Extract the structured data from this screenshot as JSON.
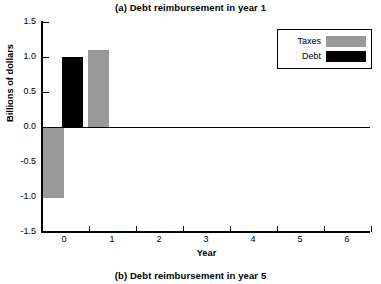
{
  "titles": {
    "top": "(a) Debt reimbursement in year 1",
    "bottom": "(b) Debt reimbursement in year 5"
  },
  "legend": {
    "items": [
      {
        "label": "Taxes",
        "color": "#999999"
      },
      {
        "label": "Debt",
        "color": "#000000"
      }
    ]
  },
  "colors": {
    "taxes": "#999999",
    "debt": "#000000",
    "axis": "#000000",
    "background": "#ffffff"
  },
  "chart_data": {
    "type": "bar",
    "title": "(a) Debt reimbursement in year 1",
    "subtitle": "(b) Debt reimbursement in year 5",
    "xlabel": "Year",
    "ylabel": "Billions of dollars",
    "xlim": [
      -0.5,
      6.5
    ],
    "ylim": [
      -1.5,
      1.5
    ],
    "yticks": [
      -1.5,
      -1.0,
      -0.5,
      0.0,
      0.5,
      1.0,
      1.5
    ],
    "ytick_labels": [
      "-1.5",
      "-1.0",
      "-0.5",
      "0.0",
      "0.5",
      "1.0",
      "1.5"
    ],
    "xticks": [
      0,
      1,
      2,
      3,
      4,
      5,
      6
    ],
    "xtick_labels": [
      "0",
      "1",
      "2",
      "3",
      "4",
      "5",
      "6"
    ],
    "grid": false,
    "legend_position": "upper right",
    "series": [
      {
        "name": "Taxes",
        "color": "#999999",
        "bars": [
          {
            "x": -0.28,
            "value": -1.0
          },
          {
            "x": 0.72,
            "value": 1.1
          }
        ]
      },
      {
        "name": "Debt",
        "color": "#000000",
        "bars": [
          {
            "x": 0.22,
            "value": 1.0
          }
        ]
      }
    ]
  },
  "bars_px": [
    {
      "name": "taxes-bar-year0-negative",
      "left": 43,
      "top": 127.5,
      "width": 21,
      "height": 70,
      "color": "#999999"
    },
    {
      "name": "debt-bar-year0-positive",
      "left": 62,
      "top": 56.5,
      "width": 21,
      "height": 70,
      "color": "#000000"
    },
    {
      "name": "taxes-bar-year1-positive",
      "left": 88,
      "top": 49.5,
      "width": 21,
      "height": 77,
      "color": "#999999"
    }
  ],
  "yticks_px": [
    {
      "label": "1.5",
      "top": 22
    },
    {
      "label": "1.0",
      "top": 57
    },
    {
      "label": "0.5",
      "top": 92
    },
    {
      "label": "0.0",
      "top": 127
    },
    {
      "label": "-0.5",
      "top": 162
    },
    {
      "label": "-1.0",
      "top": 197
    },
    {
      "label": "-1.5",
      "top": 232
    }
  ],
  "xticks_px": [
    {
      "label": "0",
      "tick": 89,
      "label_x": 64
    },
    {
      "label": "1",
      "tick": 136,
      "label_x": 112
    },
    {
      "label": "2",
      "tick": 183,
      "label_x": 159
    },
    {
      "label": "3",
      "tick": 230,
      "label_x": 206
    },
    {
      "label": "4",
      "tick": 277,
      "label_x": 253
    },
    {
      "label": "5",
      "tick": 324,
      "label_x": 300
    },
    {
      "label": "6",
      "tick": 371,
      "label_x": 347
    }
  ]
}
